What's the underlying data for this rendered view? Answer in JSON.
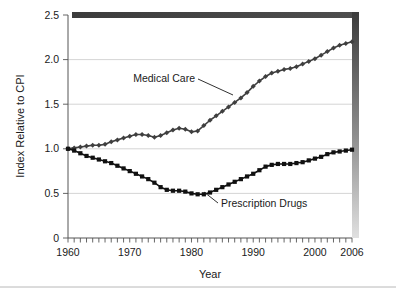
{
  "chart_data": {
    "type": "line",
    "title": "",
    "xlabel": "Year",
    "ylabel": "Index Relative to CPI",
    "xlim": [
      1960,
      2006
    ],
    "ylim": [
      0,
      2.5
    ],
    "grid": true,
    "legend_position": "inline-annotations",
    "ytick_labels": [
      "0",
      "0.5",
      "1.0",
      "1.5",
      "2.0",
      "2.5"
    ],
    "ytick_values": [
      0,
      0.5,
      1.0,
      1.5,
      2.0,
      2.5
    ],
    "xtick_labels": [
      "1960",
      "1970",
      "1980",
      "1990",
      "2000",
      "2006"
    ],
    "xtick_values": [
      1960,
      1970,
      1980,
      1990,
      2000,
      2006
    ],
    "xtick_minor_step": 1,
    "x": [
      1960,
      1961,
      1962,
      1963,
      1964,
      1965,
      1966,
      1967,
      1968,
      1969,
      1970,
      1971,
      1972,
      1973,
      1974,
      1975,
      1976,
      1977,
      1978,
      1979,
      1980,
      1981,
      1982,
      1983,
      1984,
      1985,
      1986,
      1987,
      1988,
      1989,
      1990,
      1991,
      1992,
      1993,
      1994,
      1995,
      1996,
      1997,
      1998,
      1999,
      2000,
      2001,
      2002,
      2003,
      2004,
      2005,
      2006
    ],
    "series": [
      {
        "name": "Medical Care",
        "marker": "diamond",
        "color": "#3f3f3f",
        "values": [
          1.0,
          1.01,
          1.02,
          1.03,
          1.04,
          1.04,
          1.05,
          1.08,
          1.1,
          1.12,
          1.14,
          1.16,
          1.16,
          1.15,
          1.13,
          1.15,
          1.18,
          1.21,
          1.23,
          1.22,
          1.19,
          1.2,
          1.26,
          1.32,
          1.37,
          1.42,
          1.47,
          1.52,
          1.57,
          1.63,
          1.7,
          1.76,
          1.81,
          1.85,
          1.87,
          1.89,
          1.9,
          1.92,
          1.95,
          1.98,
          2.01,
          2.05,
          2.09,
          2.13,
          2.16,
          2.18,
          2.2
        ]
      },
      {
        "name": "Prescription Drugs",
        "marker": "square",
        "color": "#111111",
        "values": [
          1.0,
          0.98,
          0.95,
          0.92,
          0.9,
          0.88,
          0.86,
          0.84,
          0.81,
          0.78,
          0.75,
          0.72,
          0.69,
          0.66,
          0.62,
          0.57,
          0.54,
          0.53,
          0.53,
          0.52,
          0.5,
          0.49,
          0.49,
          0.51,
          0.54,
          0.57,
          0.6,
          0.63,
          0.66,
          0.69,
          0.72,
          0.76,
          0.8,
          0.82,
          0.83,
          0.83,
          0.83,
          0.84,
          0.85,
          0.87,
          0.89,
          0.91,
          0.94,
          0.96,
          0.97,
          0.98,
          0.99
        ]
      }
    ],
    "annotations": [
      {
        "text": "Medical Care",
        "target_year": 1987,
        "anchor": "right-of-curve"
      },
      {
        "text": "Prescription Drugs",
        "target_year": 1982,
        "anchor": "below-right-of-curve"
      }
    ]
  },
  "figure": {
    "shadow_top_color": "#4a4a4a",
    "shadow_right_color": "#4a4a4a",
    "background": "#ffffff"
  }
}
